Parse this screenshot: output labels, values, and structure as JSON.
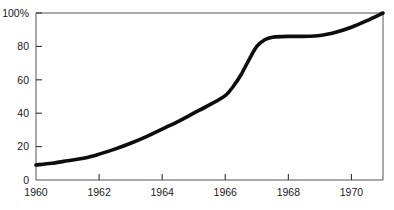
{
  "chart_data": {
    "type": "line",
    "title": "",
    "subtitle": "",
    "xlabel": "",
    "ylabel": "",
    "xlim": [
      1960,
      1971
    ],
    "ylim": [
      0,
      100
    ],
    "grid": false,
    "legend": null,
    "x_ticks": [
      1960,
      1962,
      1964,
      1966,
      1968,
      1970
    ],
    "x_tick_labels": [
      "1960",
      "1962",
      "1964",
      "1966",
      "1968",
      "1970"
    ],
    "y_ticks": [
      0,
      20,
      40,
      60,
      80,
      100
    ],
    "y_tick_labels": [
      "0",
      "20",
      "40",
      "60",
      "80",
      "100%"
    ],
    "series": [
      {
        "name": "percent",
        "x": [
          1960,
          1960.5,
          1961,
          1961.5,
          1962,
          1962.5,
          1963,
          1963.5,
          1964,
          1964.5,
          1965,
          1965.5,
          1966,
          1966.25,
          1966.5,
          1966.75,
          1967,
          1967.25,
          1967.5,
          1968,
          1968.5,
          1969,
          1969.5,
          1970,
          1970.5,
          1971
        ],
        "values": [
          9,
          10,
          11.5,
          13,
          15.5,
          18.5,
          22,
          26,
          30.5,
          35,
          40,
          45,
          50.5,
          56,
          63,
          72,
          80,
          84,
          85.5,
          86,
          86,
          86.5,
          88.5,
          91.5,
          95.5,
          100
        ]
      }
    ]
  },
  "axis": {
    "y_title": "",
    "x_title": ""
  }
}
